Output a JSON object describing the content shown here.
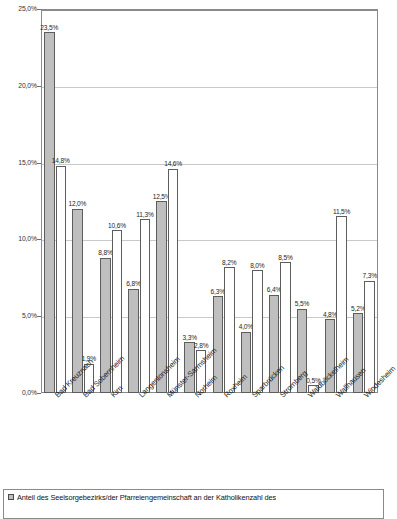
{
  "chart_data": {
    "type": "bar",
    "title": "",
    "subtitle": "",
    "xlabel": "",
    "ylabel": "",
    "ylim": [
      0,
      25
    ],
    "ytick_labels": [
      "25,0%",
      "20,0%",
      "15,0%",
      "10,0%",
      "5,0%",
      "0,0%"
    ],
    "ytick_values": [
      25,
      20,
      15,
      10,
      5,
      0
    ],
    "grid": true,
    "legend_position": "bottom",
    "orientation": "vertical",
    "grouping": "grouped",
    "categories": [
      "Bad Kreuznach",
      "Bad Sobernheim",
      "Kirn",
      "Langenlonsheim",
      "Münster-Sarmsheim",
      "Norheim",
      "Roxheim",
      "Sparbrücken",
      "Stromberg",
      "Waldböckelheim",
      "Wallhausen",
      "Windesheim"
    ],
    "series": [
      {
        "name": "Anteil des Seelsorgebezirks/der Pfarreiengemeinschaft an der Katholikenzahl des",
        "color": "#bfbfbf",
        "values": [
          23.5,
          12.0,
          8.8,
          6.8,
          12.5,
          3.3,
          6.3,
          4.0,
          6.4,
          5.5,
          4.8,
          5.2
        ],
        "data_labels": [
          "23,5%",
          "12,0%",
          "8,8%",
          "6,8%",
          "12,5%",
          "3,3%",
          "6,3%",
          "4,0%",
          "6,4%",
          "5,5%",
          "4,8%",
          "5,2%"
        ]
      },
      {
        "name": "",
        "color": "#ffffff",
        "values": [
          14.8,
          1.9,
          10.6,
          11.3,
          14.6,
          2.8,
          8.2,
          8.0,
          8.5,
          0.5,
          11.5,
          7.3
        ],
        "data_labels": [
          "14,8%",
          "1,9%",
          "10,6%",
          "11,3%",
          "14,6%",
          "2,8%",
          "8,2%",
          "8,0%",
          "8,5%",
          "0,5%",
          "11,5%",
          "7,3%"
        ]
      }
    ]
  },
  "legend": {
    "entries": [
      {
        "swatch": "s1",
        "label": "Anteil des Seelsorgebezirks/der Pfarreiengemeinschaft an der Katholikenzahl des"
      }
    ]
  }
}
